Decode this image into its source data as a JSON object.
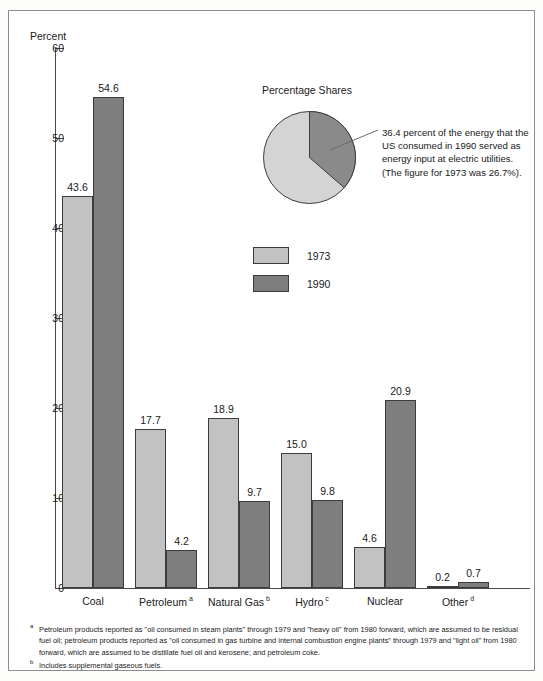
{
  "chart_data": {
    "type": "bar",
    "title": "",
    "xlabel": "",
    "ylabel": "Percent",
    "ylim": [
      0,
      60
    ],
    "yticks": [
      0,
      10,
      20,
      30,
      40,
      50,
      60
    ],
    "grid": false,
    "legend_position": "center",
    "categories": [
      "Coal",
      "Petroleum",
      "Natural Gas",
      "Hydro",
      "Nuclear",
      "Other"
    ],
    "category_footnote_marks": [
      "",
      "a",
      "b",
      "c",
      "",
      "d"
    ],
    "series": [
      {
        "name": "1973",
        "color": "#c2c2c2",
        "values": [
          43.6,
          17.7,
          18.9,
          15.0,
          4.6,
          0.2
        ]
      },
      {
        "name": "1990",
        "color": "#7e7e7e",
        "values": [
          54.6,
          4.2,
          9.7,
          9.8,
          20.9,
          0.7
        ]
      }
    ],
    "value_labels": {
      "1973": [
        "43.6",
        "17.7",
        "18.9",
        "15.0",
        "4.6",
        "0.2"
      ],
      "1990": [
        "54.6",
        "4.2",
        "9.7",
        "9.8",
        "20.9",
        "0.7"
      ]
    },
    "inset_pie": {
      "type": "pie",
      "title": "Percentage Shares",
      "slices": [
        {
          "label": "Electric utilities",
          "value": 36.4,
          "color": "#8a8a8a"
        },
        {
          "label": "Other",
          "value": 63.6,
          "color": "#d4d4d4"
        }
      ],
      "annotation": "36.4 percent of the energy that the US consumed  in 1990 served as energy input at electric utilities. (The figure for 1973 was 26.7%)."
    }
  },
  "axis": {
    "y_title": "Percent",
    "y_tick_labels": [
      "60",
      "50",
      "40",
      "30",
      "20",
      "10",
      "0"
    ]
  },
  "legend": {
    "items": [
      {
        "label": "1973",
        "color": "#c2c2c2"
      },
      {
        "label": "1990",
        "color": "#7e7e7e"
      }
    ]
  },
  "pie": {
    "title": "Percentage Shares",
    "annotation": "36.4 percent of the energy that the US consumed  in 1990 served as energy input at electric utilities. (The figure for 1973 was 26.7%)."
  },
  "footnotes": [
    {
      "mark": "a",
      "text": "Petroleum products reported as \"oil consumed in steam plants\" through 1979 and \"heavy oil\" from 1980 forward, which are assumed to be residual fuel oil; petroleum products reported as \"oil consumed in gas turbine and internal combustion engine plants\" through 1979 and \"light  oil\" from 1980 forward, which are assumed to be distillate fuel oil and kerosene; and petroleum coke."
    },
    {
      "mark": "b",
      "text": "Includes supplemental gaseous fuels."
    }
  ]
}
